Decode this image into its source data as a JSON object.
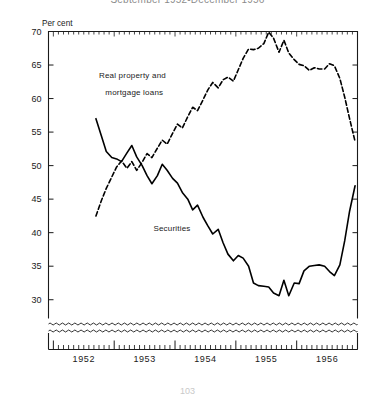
{
  "figure": {
    "title": "September 1952-December 1956",
    "page_number": "103",
    "y_axis_unit": "Per cent",
    "frame_color": "#1a1a1a",
    "series_color": "#000000"
  },
  "chart_data": {
    "type": "line",
    "title": "September 1952-December 1956",
    "xlabel": "",
    "ylabel": "Per cent",
    "ylim": [
      27.2,
      70
    ],
    "yticks": [
      30,
      35,
      40,
      45,
      50,
      55,
      60,
      65,
      70
    ],
    "ytick_labels": [
      "30",
      "35",
      "40",
      "45",
      "50",
      "55",
      "60",
      "65",
      "70"
    ],
    "xlim": [
      1951.92,
      1957.0
    ],
    "xticks": [
      1952,
      1953,
      1954,
      1955,
      1956
    ],
    "xtick_labels": [
      "1952",
      "1953",
      "1954",
      "1955",
      "1956"
    ],
    "minor_xtick_interval_months": 1,
    "grid": false,
    "legend_position": "inline-annotations",
    "axis_break": {
      "present": true,
      "style": "double-wavy",
      "below_value": 29.0
    },
    "annotations": [
      {
        "text": "Real property and",
        "x": 1953.3,
        "y": 63.0
      },
      {
        "text": "mortgage loans",
        "x": 1953.33,
        "y": 60.6
      },
      {
        "text": "Securities",
        "x": 1953.95,
        "y": 40.3
      }
    ],
    "series": [
      {
        "name": "Real property and mortgage loans",
        "style": "dashed",
        "x": [
          1952.7,
          1952.79,
          1952.87,
          1952.96,
          1953.04,
          1953.12,
          1953.21,
          1953.29,
          1953.37,
          1953.46,
          1953.54,
          1953.62,
          1953.71,
          1953.79,
          1953.87,
          1953.96,
          1954.04,
          1954.12,
          1954.21,
          1954.29,
          1954.37,
          1954.46,
          1954.54,
          1954.62,
          1954.71,
          1954.79,
          1954.87,
          1954.96,
          1955.04,
          1955.12,
          1955.21,
          1955.29,
          1955.37,
          1955.46,
          1955.54,
          1955.62,
          1955.71,
          1955.79,
          1955.87,
          1955.96,
          1956.04,
          1956.12,
          1956.21,
          1956.29,
          1956.37,
          1956.46,
          1956.54,
          1956.62,
          1956.71,
          1956.79,
          1956.87,
          1956.96
        ],
        "y": [
          42.5,
          44.8,
          46.6,
          48.3,
          49.8,
          50.7,
          49.6,
          50.6,
          49.3,
          50.5,
          51.8,
          51.2,
          52.6,
          53.8,
          53.2,
          54.8,
          56.2,
          55.6,
          57.3,
          58.7,
          58.2,
          59.8,
          61.3,
          62.4,
          61.6,
          62.8,
          63.2,
          62.6,
          64.3,
          66.0,
          67.4,
          67.3,
          67.5,
          68.2,
          69.9,
          69.0,
          66.9,
          68.7,
          66.8,
          65.8,
          65.1,
          64.9,
          64.2,
          64.6,
          64.4,
          64.4,
          65.2,
          64.9,
          63.0,
          60.2,
          57.0,
          53.6
        ]
      },
      {
        "name": "Securities",
        "style": "solid",
        "x": [
          1952.7,
          1952.79,
          1952.87,
          1952.96,
          1953.04,
          1953.12,
          1953.21,
          1953.29,
          1953.37,
          1953.46,
          1953.54,
          1953.62,
          1953.71,
          1953.79,
          1953.87,
          1953.96,
          1954.04,
          1954.12,
          1954.21,
          1954.29,
          1954.37,
          1954.46,
          1954.54,
          1954.62,
          1954.71,
          1954.79,
          1954.87,
          1954.96,
          1955.04,
          1955.12,
          1955.21,
          1955.29,
          1955.37,
          1955.46,
          1955.54,
          1955.62,
          1955.71,
          1955.79,
          1955.87,
          1955.96,
          1956.04,
          1956.12,
          1956.21,
          1956.29,
          1956.37,
          1956.46,
          1956.54,
          1956.62,
          1956.71,
          1956.79,
          1956.87,
          1956.96
        ],
        "y": [
          57.0,
          54.4,
          52.1,
          51.2,
          51.0,
          50.6,
          51.9,
          53.0,
          51.3,
          50.0,
          48.5,
          47.3,
          48.5,
          50.2,
          49.3,
          48.1,
          47.4,
          46.0,
          45.0,
          43.4,
          44.1,
          42.3,
          41.0,
          39.8,
          40.5,
          38.5,
          36.8,
          35.8,
          36.6,
          36.2,
          35.0,
          32.5,
          32.1,
          32.0,
          31.9,
          31.0,
          30.6,
          32.9,
          30.6,
          32.5,
          32.4,
          34.3,
          35.0,
          35.1,
          35.2,
          35.0,
          34.2,
          33.6,
          35.2,
          38.8,
          43.2,
          47.0
        ]
      }
    ]
  }
}
